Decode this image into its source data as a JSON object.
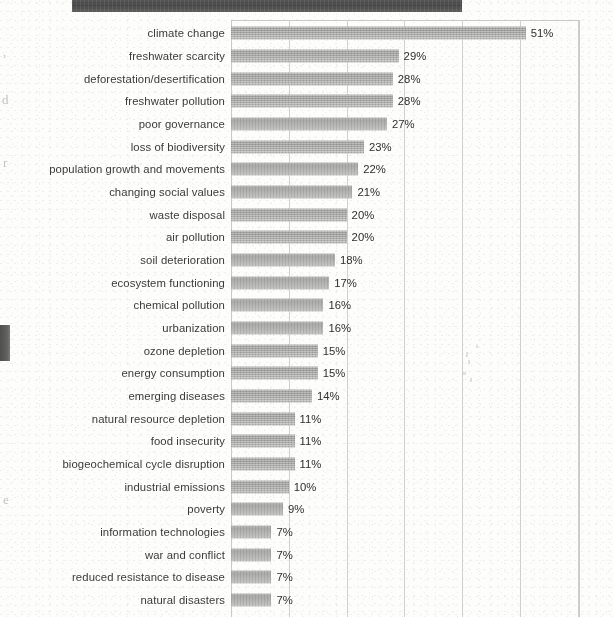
{
  "page": {
    "kind": "scanned-document-page",
    "title_banner": {
      "present": true,
      "description": "dark cut-off title bar at top of page",
      "color": "#444444"
    },
    "margin_artifacts": [
      {
        "text": ",",
        "x": 3,
        "y": 44
      },
      {
        "text": "d",
        "x": 2,
        "y": 92
      },
      {
        "text": "r",
        "x": 3,
        "y": 155
      },
      {
        "text": "e",
        "x": 3,
        "y": 492
      }
    ],
    "edge_smudge": {
      "present": true,
      "color": "#4a4a4a"
    }
  },
  "chart_data": {
    "type": "bar",
    "orientation": "horizontal",
    "title": "",
    "subtitle": "",
    "xlabel": "",
    "ylabel": "",
    "xlim": [
      0,
      60
    ],
    "gridlines": [
      10,
      20,
      30,
      40,
      50,
      60
    ],
    "grid": true,
    "legend": "none",
    "value_suffix": "%",
    "bar_color": "#a6a6a4",
    "categories": [
      "climate change",
      "freshwater scarcity",
      "deforestation/desertification",
      "freshwater pollution",
      "poor governance",
      "loss of biodiversity",
      "population growth and movements",
      "changing social values",
      "waste disposal",
      "air pollution",
      "soil deterioration",
      "ecosystem functioning",
      "chemical pollution",
      "urbanization",
      "ozone depletion",
      "energy consumption",
      "emerging diseases",
      "natural resource depletion",
      "food insecurity",
      "biogeochemical cycle disruption",
      "industrial emissions",
      "poverty",
      "information technologies",
      "war and conflict",
      "reduced resistance to disease",
      "natural disasters"
    ],
    "values": [
      51,
      29,
      28,
      28,
      27,
      23,
      22,
      21,
      20,
      20,
      18,
      17,
      16,
      16,
      15,
      15,
      14,
      11,
      11,
      11,
      10,
      9,
      7,
      7,
      7,
      7
    ],
    "value_labels": [
      "51%",
      "29%",
      "28%",
      "28%",
      "27%",
      "23%",
      "22%",
      "21%",
      "20%",
      "20%",
      "18%",
      "17%",
      "16%",
      "16%",
      "15%",
      "15%",
      "14%",
      "11%",
      "11%",
      "11%",
      "10%",
      "9%",
      "7%",
      "7%",
      "7%",
      "7%"
    ]
  }
}
